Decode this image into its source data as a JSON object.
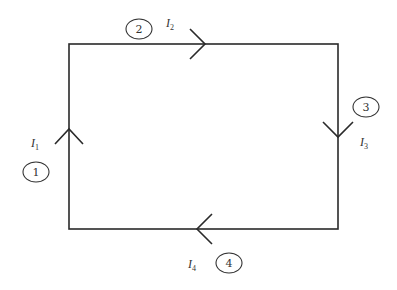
{
  "diagram": {
    "type": "current loop",
    "loop": {
      "left": 69,
      "top": 44,
      "right": 338,
      "bottom": 229
    },
    "branches": [
      {
        "id": 1,
        "label": "1",
        "current_symbol": "I",
        "current_sub": "1",
        "direction": "up",
        "edge": "left"
      },
      {
        "id": 2,
        "label": "2",
        "current_symbol": "I",
        "current_sub": "2",
        "direction": "right",
        "edge": "top"
      },
      {
        "id": 3,
        "label": "3",
        "current_symbol": "I",
        "current_sub": "3",
        "direction": "down",
        "edge": "right"
      },
      {
        "id": 4,
        "label": "4",
        "current_symbol": "I",
        "current_sub": "4",
        "direction": "left",
        "edge": "bottom"
      }
    ],
    "colors": {
      "line": "#2a2a2a",
      "background": "#ffffff"
    }
  }
}
